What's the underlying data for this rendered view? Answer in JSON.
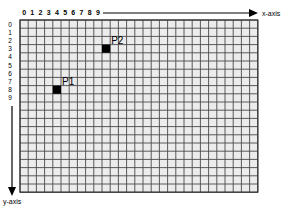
{
  "diagram": {
    "title": "",
    "grid": {
      "columns": 29,
      "rows": 21,
      "origin_px": [
        20,
        20
      ],
      "cell_px": 8.2,
      "cell_fill": "#ececec",
      "line_color": "#4a4a4a",
      "border_color": "#333333"
    },
    "x_axis": {
      "label": "x-axis",
      "tick_labels": [
        "0",
        "1",
        "2",
        "3",
        "4",
        "5",
        "6",
        "7",
        "8",
        "9"
      ]
    },
    "y_axis": {
      "label": "y-axis",
      "tick_labels": [
        "0",
        "1",
        "2",
        "3",
        "4",
        "5",
        "6",
        "7",
        "8",
        "9"
      ]
    },
    "points": [
      {
        "label": "P1",
        "col": 4,
        "row": 8,
        "color": "#000000"
      },
      {
        "label": "P2",
        "col": 10,
        "row": 3,
        "color": "#000000"
      }
    ]
  }
}
